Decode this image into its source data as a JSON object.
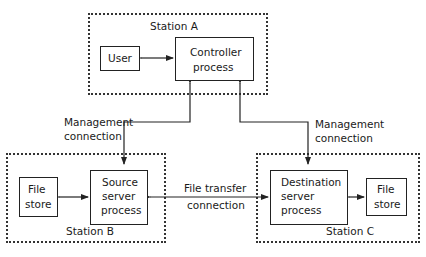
{
  "diagram": {
    "stations": {
      "a": {
        "label": "Station A"
      },
      "b": {
        "label": "Station B"
      },
      "c": {
        "label": "Station C"
      }
    },
    "nodes": {
      "user": {
        "label": "User"
      },
      "controller": {
        "line1": "Controller",
        "line2": "process"
      },
      "file_store_b": {
        "line1": "File",
        "line2": "store"
      },
      "source_server": {
        "line1": "Source",
        "line2": "server",
        "line3": "process"
      },
      "destination_server": {
        "line1": "Destination",
        "line2": "server",
        "line3": "process"
      },
      "file_store_c": {
        "line1": "File",
        "line2": "store"
      }
    },
    "edges": {
      "management_left": {
        "line1": "Management",
        "line2": "connection"
      },
      "management_right": {
        "line1": "Management",
        "line2": "connection"
      },
      "file_transfer": {
        "line1": "File transfer",
        "line2": "connection"
      }
    },
    "colors": {
      "line": "#222222",
      "background": "#ffffff"
    }
  }
}
